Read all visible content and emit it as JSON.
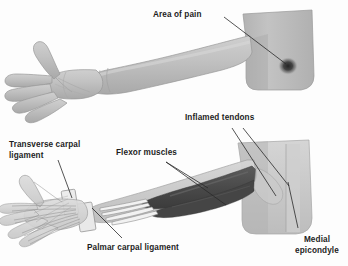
{
  "figure": {
    "panels": [
      {
        "id": "surface-anatomy",
        "name": "Surface view of arm and hand with area of pain"
      },
      {
        "id": "deep-anatomy",
        "name": "Anatomical view of forearm flexor muscles, tendons and carpal ligaments"
      }
    ]
  },
  "labels": {
    "area_of_pain": "Area of pain",
    "inflamed_tendons": "Inflamed tendons",
    "transverse_carpal_ligament": "Transverse carpal\nligament",
    "flexor_muscles": "Flexor muscles",
    "palmar_carpal_ligament": "Palmar carpal ligament",
    "medial_epicondyle": "Medial\nepicondyle"
  },
  "colors": {
    "background": "#fdfdfd",
    "skin_light": "#c4c4c4",
    "skin_mid": "#b4b4b4",
    "skin_shadow": "#a2a2a2",
    "skin_highlight": "#d2d2d2",
    "upper_arm": "#b9b9b9",
    "pain_spot": "#3a3a3a",
    "muscle_dark": "#4f4f4f",
    "muscle_darker": "#3f3f3f",
    "tendon_light": "#efefef",
    "bone_light": "#e4e4e4",
    "outline": "#6f6f6f",
    "leader_line": "#2a2a2a",
    "label_text": "#1d1d1d"
  }
}
